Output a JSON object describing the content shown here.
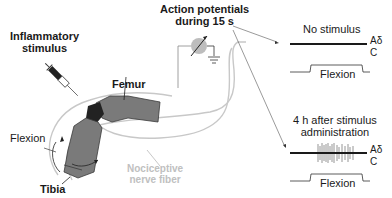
{
  "labels": {
    "stimulus": [
      "Inflammatory",
      "stimulus"
    ],
    "femur": "Femur",
    "tibia": "Tibia",
    "flexion_left": "Flexion",
    "nerve": [
      "Nociceptive",
      "nerve fiber"
    ],
    "recording": [
      "Action potentials",
      "during 15 s"
    ]
  },
  "panels": [
    {
      "title": [
        "No stimulus"
      ],
      "fiber_labels": [
        "Aδ",
        "C"
      ],
      "flexion_label": "Flexion",
      "spikes": false
    },
    {
      "title": [
        "4 h after stimulus",
        "administration"
      ],
      "fiber_labels": [
        "Aδ",
        "C"
      ],
      "flexion_label": "Flexion",
      "spikes": true
    }
  ],
  "colors": {
    "bone": "#7a7a7a",
    "joint": "#222222",
    "nerve": "#c8c8c8",
    "electrode": "#bdbdbd",
    "trace": "#1a1a1a",
    "spikes": "#8a8a8a"
  }
}
